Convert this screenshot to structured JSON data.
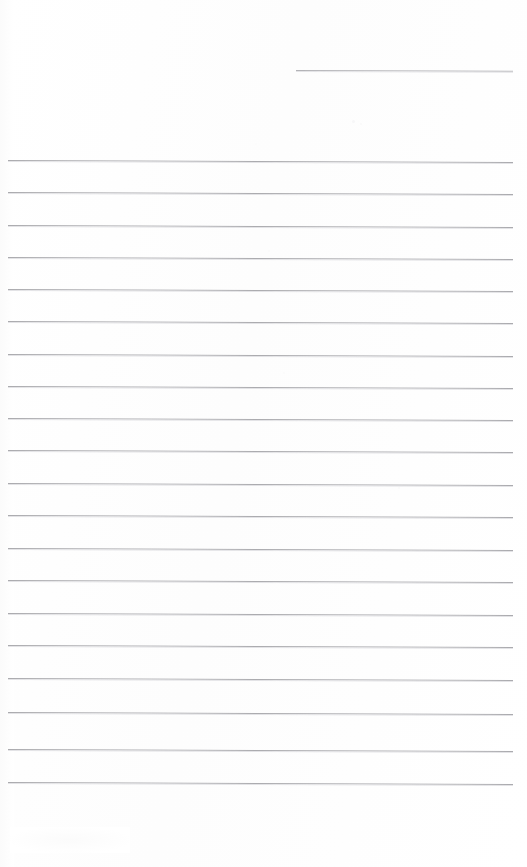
{
  "document": {
    "kind": "scanned-blank-ruled-notebook-page",
    "page_width": 527,
    "page_height": 867,
    "background_color": "#fefefe",
    "rule_color": "#a7a7ab",
    "rule_halo_color": "#e2e2e5",
    "rule_thickness_px": 1,
    "text_content": "",
    "handwriting_present": "no",
    "printed_text_present": "no"
  },
  "ruling": {
    "style": "wide-ruled horizontal lines",
    "line_spacing_px": 32.7,
    "left_margin_x": 8,
    "right_margin_x": 513,
    "first_full_line_y": 161,
    "last_full_line_y": 782,
    "full_line_count": 20,
    "vertical_margin_rule": "none",
    "slant_deg": 0.22
  },
  "lines": [
    {
      "id": "rule-header",
      "label": "short top-right rule",
      "x": 296,
      "y": 70,
      "width": 217,
      "full_width": false
    },
    {
      "id": "rule-01",
      "label": "rule 1",
      "x": 8,
      "y": 160,
      "width": 505,
      "full_width": true
    },
    {
      "id": "rule-02",
      "label": "rule 2",
      "x": 8,
      "y": 192,
      "width": 505,
      "full_width": true
    },
    {
      "id": "rule-03",
      "label": "rule 3",
      "x": 8,
      "y": 225,
      "width": 505,
      "full_width": true
    },
    {
      "id": "rule-04",
      "label": "rule 4",
      "x": 8,
      "y": 257,
      "width": 505,
      "full_width": true
    },
    {
      "id": "rule-05",
      "label": "rule 5",
      "x": 8,
      "y": 289,
      "width": 505,
      "full_width": true
    },
    {
      "id": "rule-06",
      "label": "rule 6",
      "x": 8,
      "y": 321,
      "width": 505,
      "full_width": true
    },
    {
      "id": "rule-07",
      "label": "rule 7",
      "x": 8,
      "y": 354,
      "width": 505,
      "full_width": true
    },
    {
      "id": "rule-08",
      "label": "rule 8",
      "x": 8,
      "y": 386,
      "width": 505,
      "full_width": true
    },
    {
      "id": "rule-09",
      "label": "rule 9",
      "x": 8,
      "y": 418,
      "width": 505,
      "full_width": true
    },
    {
      "id": "rule-10",
      "label": "rule 10",
      "x": 8,
      "y": 450,
      "width": 505,
      "full_width": true
    },
    {
      "id": "rule-11",
      "label": "rule 11",
      "x": 8,
      "y": 483,
      "width": 505,
      "full_width": true
    },
    {
      "id": "rule-12",
      "label": "rule 12",
      "x": 8,
      "y": 515,
      "width": 505,
      "full_width": true
    },
    {
      "id": "rule-13",
      "label": "rule 13",
      "x": 8,
      "y": 548,
      "width": 505,
      "full_width": true
    },
    {
      "id": "rule-14",
      "label": "rule 14",
      "x": 8,
      "y": 580,
      "width": 505,
      "full_width": true
    },
    {
      "id": "rule-15",
      "label": "rule 15",
      "x": 8,
      "y": 613,
      "width": 505,
      "full_width": true
    },
    {
      "id": "rule-16",
      "label": "rule 16",
      "x": 8,
      "y": 645,
      "width": 505,
      "full_width": true
    },
    {
      "id": "rule-17",
      "label": "rule 17",
      "x": 8,
      "y": 678,
      "width": 505,
      "full_width": true
    },
    {
      "id": "rule-18",
      "label": "rule 18",
      "x": 8,
      "y": 712,
      "width": 505,
      "full_width": true
    },
    {
      "id": "rule-19",
      "label": "rule 19",
      "x": 8,
      "y": 749,
      "width": 505,
      "full_width": true
    },
    {
      "id": "rule-20",
      "label": "rule 20",
      "x": 8,
      "y": 782,
      "width": 505,
      "full_width": true
    }
  ],
  "artifacts": [
    {
      "id": "speck-a",
      "x": 352,
      "y": 120,
      "size": 3,
      "color": "#f7f7f8"
    },
    {
      "id": "speck-b",
      "x": 360,
      "y": 123,
      "size": 2,
      "color": "#f8f8f9"
    },
    {
      "id": "speck-c",
      "x": 268,
      "y": 250,
      "size": 2,
      "color": "#fafafa"
    },
    {
      "id": "speck-d",
      "x": 283,
      "y": 372,
      "size": 2,
      "color": "#fafafa"
    },
    {
      "id": "speck-e",
      "x": 398,
      "y": 487,
      "size": 2,
      "color": "#fafafa"
    },
    {
      "id": "speck-f",
      "x": 255,
      "y": 143,
      "size": 2,
      "color": "#fbfbfb"
    }
  ]
}
